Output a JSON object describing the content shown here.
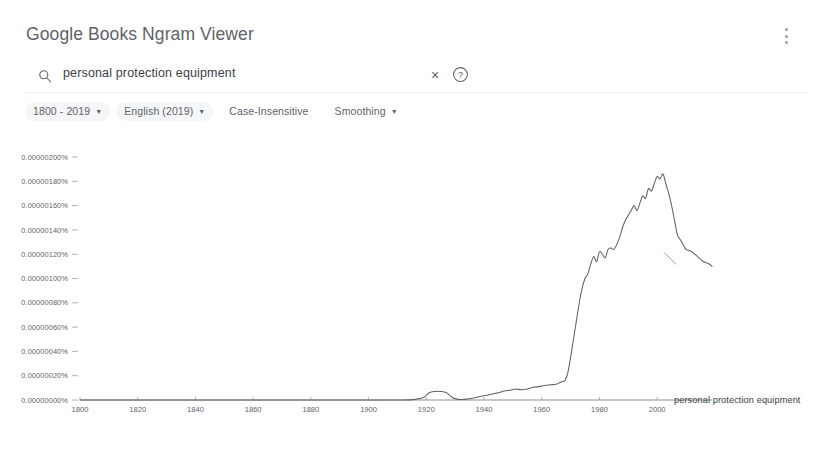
{
  "header": {
    "title": "Google Books Ngram Viewer",
    "overflow_menu_icon": "more-vert-icon"
  },
  "search": {
    "icon": "search-icon",
    "value": "personal protection equipment",
    "placeholder": "Search in Google Books Ngram Viewer",
    "clear_icon": "close-icon",
    "clear_label": "×",
    "help_icon": "help-circle-icon",
    "help_label": "?"
  },
  "filters": [
    {
      "label": "1800 - 2019",
      "has_caret": true,
      "style": "chip",
      "name": "date-range-chip"
    },
    {
      "label": "English (2019)",
      "has_caret": true,
      "style": "chip",
      "name": "corpus-chip"
    },
    {
      "label": "Case-Insensitive",
      "has_caret": false,
      "style": "plain",
      "name": "case-insensitive-chip"
    },
    {
      "label": "Smoothing",
      "has_caret": true,
      "style": "plain",
      "name": "smoothing-chip"
    }
  ],
  "chart_footnote": "(click on line/label for focus)",
  "series_label": "personal protection equipment",
  "chart_data": {
    "type": "line",
    "title": "",
    "xlabel": "",
    "ylabel": "",
    "grid": false,
    "legend_position": "right-inline",
    "xlim": [
      1800,
      2019
    ],
    "ylim": [
      0.0,
      2e-06
    ],
    "xticks": [
      1800,
      1820,
      1840,
      1860,
      1880,
      1900,
      1920,
      1940,
      1960,
      1980,
      2000
    ],
    "ytick_labels": [
      "0.00000200%",
      "0.00000180%",
      "0.00000160%",
      "0.00000140%",
      "0.00000120%",
      "0.00000100%",
      "0.00000080%",
      "0.00000060%",
      "0.00000040%",
      "0.00000020%",
      "0.00000000%"
    ],
    "ytick_values": [
      2e-06,
      1.8e-06,
      1.6e-06,
      1.4e-06,
      1.2e-06,
      1e-06,
      8e-07,
      6e-07,
      4e-07,
      2e-07,
      0.0
    ],
    "series": [
      {
        "name": "personal protection equipment",
        "color": "#5f6368",
        "x": [
          1800,
          1820,
          1840,
          1860,
          1880,
          1895,
          1905,
          1912,
          1916,
          1919,
          1921,
          1923,
          1925,
          1927,
          1929,
          1931,
          1933,
          1935,
          1937,
          1939,
          1941,
          1943,
          1945,
          1947,
          1949,
          1951,
          1953,
          1955,
          1957,
          1959,
          1961,
          1963,
          1965,
          1966,
          1967,
          1968,
          1969,
          1970,
          1971,
          1972,
          1973,
          1974,
          1975,
          1976,
          1977,
          1978,
          1979,
          1980,
          1981,
          1982,
          1983,
          1984,
          1985,
          1986,
          1987,
          1988,
          1989,
          1990,
          1991,
          1992,
          1993,
          1994,
          1995,
          1996,
          1997,
          1998,
          1999,
          2000,
          2001,
          2002,
          2003,
          2004,
          2005,
          2006,
          2007,
          2008,
          2009,
          2010,
          2012,
          2014,
          2016,
          2018,
          2019
        ],
        "y": [
          0.0,
          0.0,
          0.0,
          0.0,
          0.0,
          0.0,
          0.0,
          0.0,
          5e-09,
          2e-08,
          6e-08,
          7e-08,
          7e-08,
          6e-08,
          2e-08,
          5e-09,
          5e-09,
          1e-08,
          2e-08,
          3e-08,
          4e-08,
          5e-08,
          6e-08,
          7.5e-08,
          8e-08,
          9e-08,
          8.5e-08,
          9e-08,
          1.05e-07,
          1.1e-07,
          1.2e-07,
          1.25e-07,
          1.3e-07,
          1.4e-07,
          1.5e-07,
          1.6e-07,
          2.2e-07,
          3.5e-07,
          5e-07,
          6.5e-07,
          8e-07,
          9.2e-07,
          1e-06,
          1.04e-06,
          1.12e-06,
          1.18e-06,
          1.14e-06,
          1.22e-06,
          1.2e-06,
          1.17e-06,
          1.24e-06,
          1.25e-06,
          1.24e-06,
          1.28e-06,
          1.34e-06,
          1.42e-06,
          1.48e-06,
          1.52e-06,
          1.56e-06,
          1.6e-06,
          1.56e-06,
          1.62e-06,
          1.68e-06,
          1.66e-06,
          1.74e-06,
          1.72e-06,
          1.78e-06,
          1.84e-06,
          1.82e-06,
          1.86e-06,
          1.78e-06,
          1.7e-06,
          1.6e-06,
          1.48e-06,
          1.36e-06,
          1.32e-06,
          1.28e-06,
          1.24e-06,
          1.22e-06,
          1.18e-06,
          1.14e-06,
          1.12e-06,
          1.1e-06
        ]
      }
    ]
  }
}
